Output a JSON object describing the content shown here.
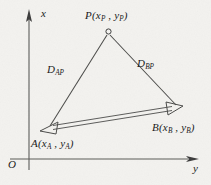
{
  "figure": {
    "type": "geometry-diagram",
    "background_color": "#f3f2ef",
    "line_color": "#3a3a3a",
    "axes": {
      "vertical_label": "x",
      "horizontal_label": "y",
      "origin_label": "O"
    },
    "points": [
      {
        "id": "P",
        "label_name": "P",
        "label_coords": "(x_P , y_P)",
        "sub_x": "P",
        "sub_y": "P",
        "marker": "open-circle",
        "x": 108,
        "y": 31
      },
      {
        "id": "A",
        "label_name": "A",
        "label_coords": "(x_A , y_A)",
        "sub_x": "A",
        "sub_y": "A",
        "marker": "open-arrowhead",
        "x": 47,
        "y": 128
      },
      {
        "id": "B",
        "label_name": "B",
        "label_coords": "(x_B , y_B)",
        "sub_x": "B",
        "sub_y": "B",
        "marker": "open-arrowhead",
        "x": 178,
        "y": 108
      }
    ],
    "segments": [
      {
        "id": "AP",
        "label_name": "D",
        "label_sub": "AP",
        "from": "A",
        "to": "P",
        "style": "single-line"
      },
      {
        "id": "BP",
        "label_name": "D",
        "label_sub": "BP",
        "from": "B",
        "to": "P",
        "style": "single-line"
      },
      {
        "id": "AB",
        "label_name": "",
        "label_sub": "",
        "from": "A",
        "to": "B",
        "style": "double-line-arrows"
      }
    ],
    "labels": {
      "p_name": "P",
      "p_open": "(",
      "p_x": "x",
      "p_x_sub": "P",
      "p_comma": " , ",
      "p_y": "y",
      "p_y_sub": "P",
      "p_close": ")",
      "a_name": "A",
      "a_open": "(",
      "a_x": "x",
      "a_x_sub": "A",
      "a_comma": " , ",
      "a_y": "y",
      "a_y_sub": "A",
      "a_close": ")",
      "b_name": "B",
      "b_open": "(",
      "b_x": "x",
      "b_x_sub": "B",
      "b_comma": " , ",
      "b_y": "y",
      "b_y_sub": "B",
      "b_close": ")",
      "d_ap_name": "D",
      "d_ap_sub": "AP",
      "d_bp_name": "D",
      "d_bp_sub": "BP",
      "axis_x": "x",
      "axis_y": "y",
      "origin": "O"
    }
  }
}
